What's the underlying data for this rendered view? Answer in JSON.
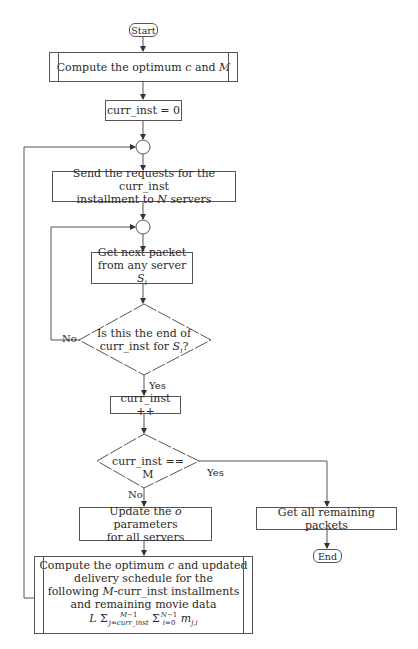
{
  "nodes": {
    "start": "Start",
    "compute_initial": "Compute the optimum c and M",
    "init_counter": "curr_inst = 0",
    "send_requests_line1": "Send the requests for the curr_inst",
    "send_requests_line2": "installment to N servers",
    "get_packet_line1": "Get next packet",
    "get_packet_line2": "from any server S_i",
    "decision_end_line1": "Is this the end of",
    "decision_end_line2": "curr_inst for S_i?",
    "increment": "curr_inst ++",
    "decision_last": "curr_inst == M",
    "update_params_line1": "Update the o parameters",
    "update_params_line2": "for all servers",
    "get_remaining": "Get all remaining packets",
    "end": "End",
    "compute_updated_line1": "Compute the optimum c and updated",
    "compute_updated_line2": "delivery schedule for the",
    "compute_updated_line3": "following M-curr_inst installments",
    "compute_updated_line4": "and remaining movie data",
    "compute_updated_formula": "L Σ_{j=curr_inst}^{M-1} Σ_{i=0}^{N-1} m_{j,i}"
  },
  "edge_labels": {
    "no_1": "No",
    "yes_1": "Yes",
    "yes_2": "Yes",
    "no_2": "No"
  },
  "colors": {
    "line": "#555555",
    "text": "#2a2a2a",
    "background": "#ffffff"
  }
}
